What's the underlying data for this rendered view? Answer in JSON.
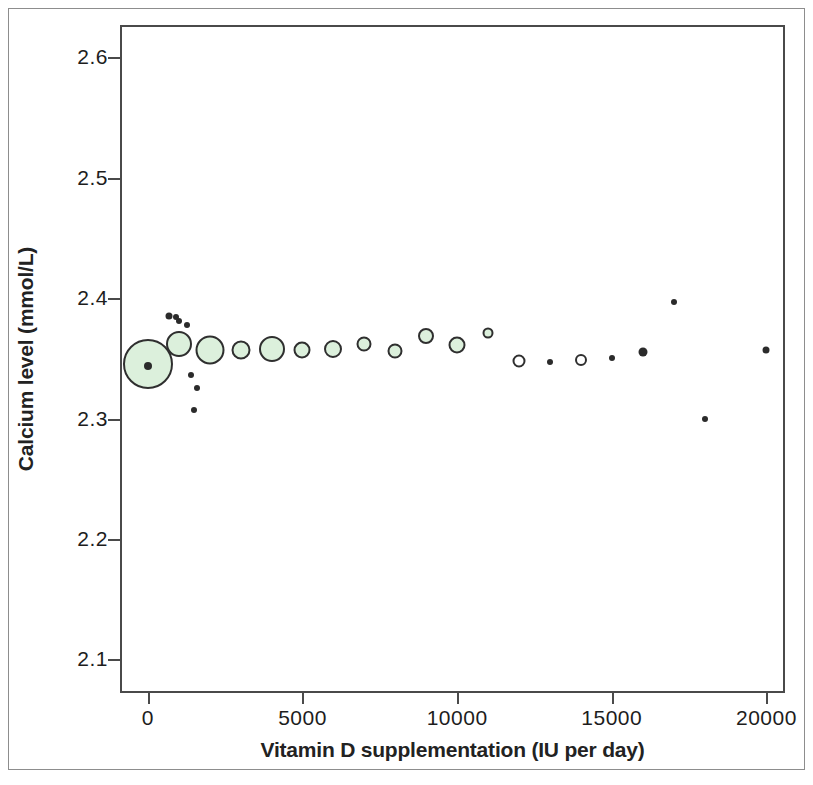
{
  "chart_data": {
    "type": "scatter",
    "title": "",
    "xlabel": "Vitamin D supplementation (IU per day)",
    "ylabel": "Calcium level (mmol/L)",
    "xlim": [
      -900,
      20600
    ],
    "ylim": [
      2.072,
      2.627
    ],
    "xticks": [
      0,
      5000,
      10000,
      15000,
      20000
    ],
    "xticklabels": [
      "0",
      "5000",
      "10000",
      "15000",
      "20000"
    ],
    "yticks": [
      2.1,
      2.2,
      2.3,
      2.4,
      2.5,
      2.6
    ],
    "yticklabels": [
      "2.1",
      "2.2",
      "2.3",
      "2.4",
      "2.5",
      "2.6"
    ],
    "grid": false,
    "legend": null,
    "marker_style": "bubble-size-weighted",
    "colors": {
      "bubble_fill": "#dcf0dc",
      "bubble_edge": "#2f2f2f",
      "dot": "#2b2b2b",
      "frame": "#4a4a4a",
      "text": "#1d1d1d",
      "background": "#ffffff"
    },
    "series": [
      {
        "name": "Weighted study estimates",
        "note": "Bubble radius is proportional to study weight",
        "points": [
          {
            "x": 0,
            "y": 2.345,
            "r": 25,
            "filled": true
          },
          {
            "x": 1000,
            "y": 2.362,
            "r": 13,
            "filled": true
          },
          {
            "x": 2000,
            "y": 2.357,
            "r": 14.5,
            "filled": true
          },
          {
            "x": 3000,
            "y": 2.357,
            "r": 9.5,
            "filled": true
          },
          {
            "x": 4000,
            "y": 2.358,
            "r": 13,
            "filled": true
          },
          {
            "x": 5000,
            "y": 2.357,
            "r": 8.5,
            "filled": true
          },
          {
            "x": 6000,
            "y": 2.358,
            "r": 9,
            "filled": true
          },
          {
            "x": 7000,
            "y": 2.362,
            "r": 7.5,
            "filled": true
          },
          {
            "x": 8000,
            "y": 2.356,
            "r": 7.5,
            "filled": true
          },
          {
            "x": 9000,
            "y": 2.369,
            "r": 8,
            "filled": true
          },
          {
            "x": 10000,
            "y": 2.361,
            "r": 8.5,
            "filled": true
          },
          {
            "x": 11000,
            "y": 2.371,
            "r": 5.5,
            "filled": true
          },
          {
            "x": 12000,
            "y": 2.348,
            "r": 6.5,
            "filled": false
          },
          {
            "x": 13000,
            "y": 2.347,
            "r": 3,
            "filled": false
          },
          {
            "x": 14000,
            "y": 2.349,
            "r": 6,
            "filled": false
          },
          {
            "x": 15000,
            "y": 2.35,
            "r": 3,
            "filled": false
          },
          {
            "x": 16000,
            "y": 2.355,
            "r": 4.5,
            "filled": false
          },
          {
            "x": 17000,
            "y": 2.397,
            "r": 3,
            "filled": false
          },
          {
            "x": 18000,
            "y": 2.3,
            "r": 3,
            "filled": false
          },
          {
            "x": 20000,
            "y": 2.357,
            "r": 3.5,
            "filled": false
          }
        ]
      },
      {
        "name": "Individual observations",
        "note": "Small solid dots, unweighted",
        "points": [
          {
            "x": 700,
            "y": 2.385,
            "r": 3.5,
            "filled": true
          },
          {
            "x": 900,
            "y": 2.384,
            "r": 3,
            "filled": true
          },
          {
            "x": 1000,
            "y": 2.381,
            "r": 3,
            "filled": true
          },
          {
            "x": 1250,
            "y": 2.378,
            "r": 3,
            "filled": true
          },
          {
            "x": 0,
            "y": 2.344,
            "r": 4,
            "filled": true
          },
          {
            "x": 1400,
            "y": 2.336,
            "r": 3,
            "filled": true
          },
          {
            "x": 1600,
            "y": 2.325,
            "r": 3,
            "filled": true
          },
          {
            "x": 1500,
            "y": 2.307,
            "r": 3,
            "filled": true
          }
        ]
      }
    ]
  }
}
